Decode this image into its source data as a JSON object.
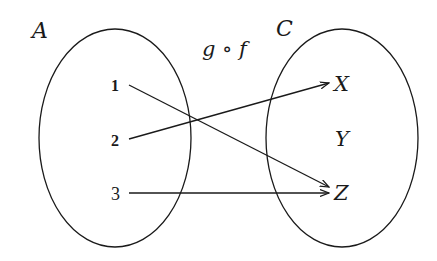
{
  "title": "g ∘ f",
  "colors": {
    "stroke": "#1a1a1a",
    "background": "#ffffff"
  },
  "sets": [
    {
      "name": "A",
      "label": "A",
      "elements": [
        "1",
        "2",
        "3"
      ]
    },
    {
      "name": "C",
      "label": "C",
      "elements": [
        "X",
        "Y",
        "Z"
      ]
    }
  ],
  "mapping_label": "g ∘ f",
  "domain_elements": [
    {
      "label": "1"
    },
    {
      "label": "2"
    },
    {
      "label": "3"
    }
  ],
  "codomain_elements": [
    {
      "label": "X"
    },
    {
      "label": "Y"
    },
    {
      "label": "Z"
    }
  ],
  "arrows": [
    {
      "from": "1",
      "to": "Z"
    },
    {
      "from": "2",
      "to": "X"
    },
    {
      "from": "3",
      "to": "Z"
    }
  ]
}
